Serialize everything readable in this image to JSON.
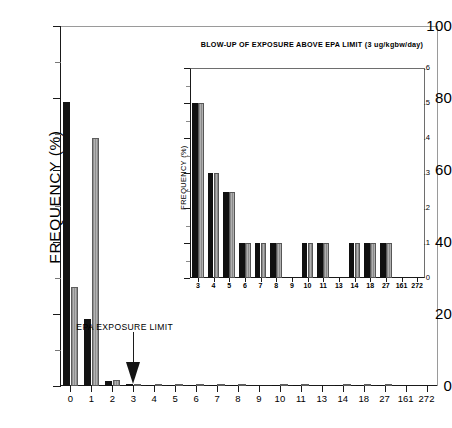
{
  "chart_data": [
    {
      "id": "main",
      "type": "bar",
      "title": "",
      "xlabel": "",
      "ylabel": "FREQUENCY (%)",
      "ylim": [
        0,
        100
      ],
      "yticks": [
        0,
        20,
        40,
        60,
        80,
        100
      ],
      "ytick_labels": [
        "0",
        "20",
        "40",
        "60",
        "80",
        "100"
      ],
      "yminor_step": 10,
      "grid": false,
      "legend": "none",
      "categories": [
        "0",
        "1",
        "2",
        "3",
        "4",
        "5",
        "6",
        "7",
        "8",
        "9",
        "10",
        "11",
        "13",
        "14",
        "18",
        "27",
        "161",
        "272"
      ],
      "series": [
        {
          "name": "series-black",
          "fill": "black",
          "values": [
            79.0,
            18.5,
            1.4,
            0.5,
            0.3,
            0.2,
            0.2,
            0.2,
            0.2,
            0.0,
            0.2,
            0.2,
            0.0,
            0.2,
            0.2,
            0.2,
            0.0,
            0.0
          ]
        },
        {
          "name": "series-gray",
          "fill": "gray-hatch",
          "values": [
            27.5,
            69.0,
            1.7,
            0.4,
            0.2,
            0.2,
            0.2,
            0.2,
            0.2,
            0.0,
            0.2,
            0.2,
            0.0,
            0.2,
            0.2,
            0.2,
            0.0,
            0.0
          ]
        }
      ],
      "annotations": [
        {
          "name": "epa-exposure-limit",
          "text": "EPA EXPOSURE LIMIT",
          "points_to_category": "3",
          "arrow": "down"
        }
      ]
    },
    {
      "id": "inset",
      "type": "bar",
      "title": "BLOW-UP OF EXPOSURE ABOVE EPA LIMIT (3 ug/kgbw/day)",
      "xlabel": "",
      "ylabel": "FREQUENCY (%)",
      "ylim": [
        0,
        0.6
      ],
      "yticks": [
        0,
        0.1,
        0.2,
        0.3,
        0.4,
        0.5,
        0.6
      ],
      "ytick_labels": [
        "0",
        ".1",
        ".2",
        ".3",
        ".4",
        ".5",
        ".6"
      ],
      "yminor_step": 0.05,
      "grid": false,
      "legend": "none",
      "categories": [
        "3",
        "4",
        "5",
        "6",
        "7",
        "8",
        "9",
        "10",
        "11",
        "13",
        "14",
        "18",
        "27",
        "161",
        "272"
      ],
      "series": [
        {
          "name": "series-black",
          "fill": "black",
          "values": [
            0.5,
            0.3,
            0.245,
            0.1,
            0.1,
            0.1,
            0.0,
            0.1,
            0.1,
            0.0,
            0.1,
            0.1,
            0.1,
            0.0,
            0.0
          ]
        },
        {
          "name": "series-gray",
          "fill": "gray-hatch",
          "values": [
            0.5,
            0.3,
            0.245,
            0.1,
            0.1,
            0.1,
            0.0,
            0.1,
            0.1,
            0.0,
            0.1,
            0.1,
            0.1,
            0.0,
            0.0
          ]
        }
      ]
    }
  ],
  "colors": {
    "series_black": "#131313",
    "series_gray": "#a8a8a8",
    "axis": "#1a1a1a",
    "background": "#ffffff"
  }
}
